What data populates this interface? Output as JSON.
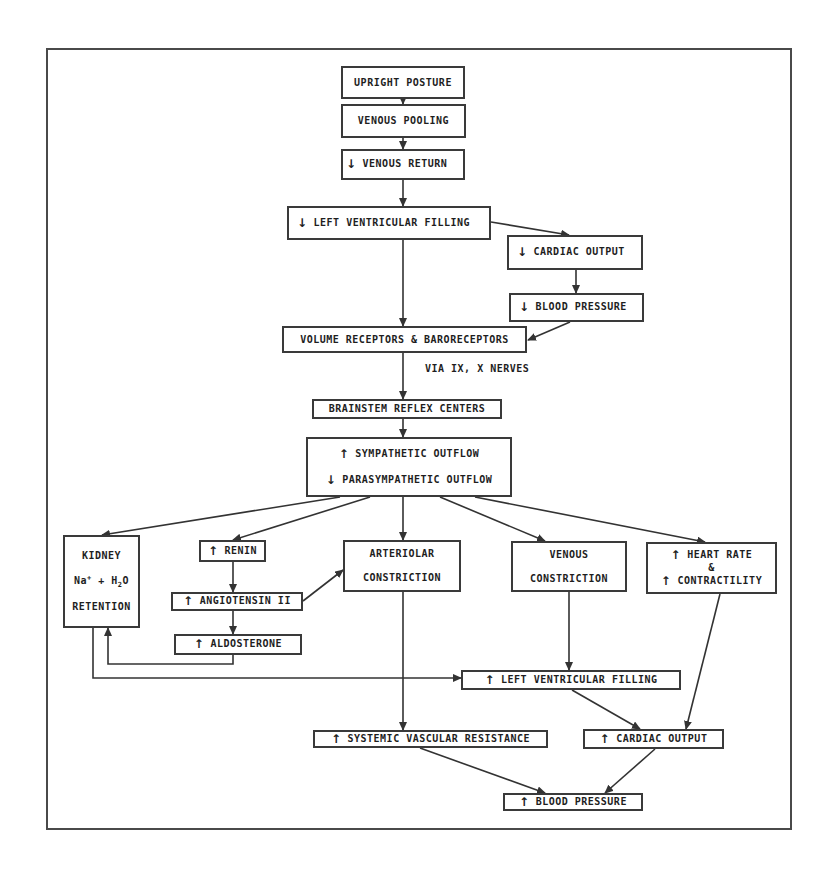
{
  "diagram": {
    "type": "flowchart",
    "title": "",
    "arrow_symbols": {
      "up": "↑",
      "down": "↓"
    },
    "nodes": {
      "upright_posture": {
        "label": "UPRIGHT POSTURE"
      },
      "venous_pooling": {
        "label": "VENOUS POOLING"
      },
      "venous_return": {
        "arrow": "↓",
        "label": "VENOUS RETURN"
      },
      "lv_filling_1": {
        "arrow": "↓",
        "label": "LEFT VENTRICULAR FILLING"
      },
      "cardiac_output_1": {
        "arrow": "↓",
        "label": "CARDIAC OUTPUT"
      },
      "blood_pressure_1": {
        "arrow": "↓",
        "label": "BLOOD PRESSURE"
      },
      "receptors": {
        "label": "VOLUME RECEPTORS & BARORECEPTORS"
      },
      "brainstem": {
        "label": "BRAINSTEM REFLEX CENTERS"
      },
      "autonomic": {
        "line1_arrow": "↑",
        "line1": "SYMPATHETIC OUTFLOW",
        "line2_arrow": "↓",
        "line2": "PARASYMPATHETIC OUTFLOW"
      },
      "kidney": {
        "line1": "KIDNEY",
        "line2_a": "Na",
        "line2_sup": "+",
        "line2_b": " + H",
        "line2_sub": "2",
        "line2_c": "O",
        "line3": "RETENTION"
      },
      "renin": {
        "arrow": "↑",
        "label": "RENIN"
      },
      "angiotensin": {
        "arrow": "↑",
        "label": "ANGIOTENSIN II"
      },
      "aldosterone": {
        "arrow": "↑",
        "label": "ALDOSTERONE"
      },
      "arteriolar": {
        "line1": "ARTERIOLAR",
        "line2": "CONSTRICTION"
      },
      "venous_constriction": {
        "line1": "VENOUS",
        "line2": "CONSTRICTION"
      },
      "heart": {
        "line1_arrow": "↑",
        "line1": "HEART RATE",
        "line2": "&",
        "line3_arrow": "↑",
        "line3": "CONTRACTILITY"
      },
      "lv_filling_2": {
        "arrow": "↑",
        "label": "LEFT VENTRICULAR FILLING"
      },
      "svr": {
        "arrow": "↑",
        "label": "SYSTEMIC VASCULAR RESISTANCE"
      },
      "cardiac_output_2": {
        "arrow": "↑",
        "label": "CARDIAC OUTPUT"
      },
      "blood_pressure_2": {
        "arrow": "↑",
        "label": "BLOOD PRESSURE"
      }
    },
    "annotations": {
      "nerves": "VIA IX, X NERVES"
    },
    "edges": [
      [
        "upright_posture",
        "venous_pooling"
      ],
      [
        "venous_pooling",
        "venous_return"
      ],
      [
        "venous_return",
        "lv_filling_1"
      ],
      [
        "lv_filling_1",
        "cardiac_output_1"
      ],
      [
        "lv_filling_1",
        "receptors"
      ],
      [
        "cardiac_output_1",
        "blood_pressure_1"
      ],
      [
        "blood_pressure_1",
        "receptors"
      ],
      [
        "receptors",
        "brainstem"
      ],
      [
        "brainstem",
        "autonomic"
      ],
      [
        "autonomic",
        "kidney"
      ],
      [
        "autonomic",
        "renin"
      ],
      [
        "autonomic",
        "arteriolar"
      ],
      [
        "autonomic",
        "venous_constriction"
      ],
      [
        "autonomic",
        "heart"
      ],
      [
        "renin",
        "angiotensin"
      ],
      [
        "angiotensin",
        "aldosterone"
      ],
      [
        "angiotensin",
        "arteriolar"
      ],
      [
        "aldosterone",
        "kidney"
      ],
      [
        "kidney",
        "lv_filling_2"
      ],
      [
        "venous_constriction",
        "lv_filling_2"
      ],
      [
        "arteriolar",
        "svr"
      ],
      [
        "lv_filling_2",
        "cardiac_output_2"
      ],
      [
        "heart",
        "cardiac_output_2"
      ],
      [
        "svr",
        "blood_pressure_2"
      ],
      [
        "cardiac_output_2",
        "blood_pressure_2"
      ]
    ]
  }
}
